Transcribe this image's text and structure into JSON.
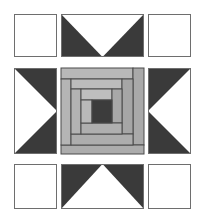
{
  "diagram": {
    "type": "quilt-block",
    "colors": {
      "background": "#ffffff",
      "outline": "#6e6e6e",
      "dark": "#3a3a3a",
      "light_gray": "#b9b9b9",
      "mid_gray": "#a8a8a8",
      "strip_line": "#4a4a4a",
      "center_square": "#3c3c3c"
    },
    "grid": {
      "columns": [
        [
          14,
          57
        ],
        [
          61,
          144
        ],
        [
          148,
          191
        ]
      ],
      "rows": [
        [
          14,
          57
        ],
        [
          68,
          153
        ],
        [
          164,
          208
        ]
      ]
    },
    "cells": [
      {
        "id": "top-left",
        "kind": "plain-square"
      },
      {
        "id": "top-middle",
        "kind": "flying-geese",
        "white_apex": "down"
      },
      {
        "id": "top-right",
        "kind": "plain-square"
      },
      {
        "id": "middle-left",
        "kind": "flying-geese",
        "white_apex": "right"
      },
      {
        "id": "center",
        "kind": "log-cabin",
        "rings": 3
      },
      {
        "id": "middle-right",
        "kind": "flying-geese",
        "white_apex": "left"
      },
      {
        "id": "bottom-left",
        "kind": "plain-square"
      },
      {
        "id": "bottom-middle",
        "kind": "flying-geese",
        "white_apex": "up"
      },
      {
        "id": "bottom-right",
        "kind": "plain-square"
      }
    ]
  }
}
